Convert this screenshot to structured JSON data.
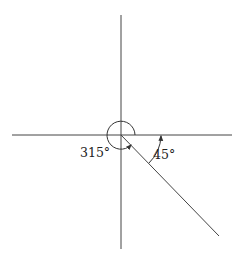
{
  "diagram": {
    "type": "angle-diagram",
    "labels": {
      "reflex_angle": "315°",
      "acute_angle": "45°"
    },
    "elements": [
      {
        "kind": "axis",
        "orientation": "horizontal"
      },
      {
        "kind": "axis",
        "orientation": "vertical"
      },
      {
        "kind": "ray",
        "direction_deg": -45
      },
      {
        "kind": "arc",
        "angle_deg": 315,
        "direction": "counterclockwise",
        "label": "315°"
      },
      {
        "kind": "arc",
        "angle_deg": 45,
        "direction": "counterclockwise",
        "label": "45°"
      }
    ],
    "colors": {
      "stroke": "#333333",
      "background": "#ffffff"
    }
  }
}
